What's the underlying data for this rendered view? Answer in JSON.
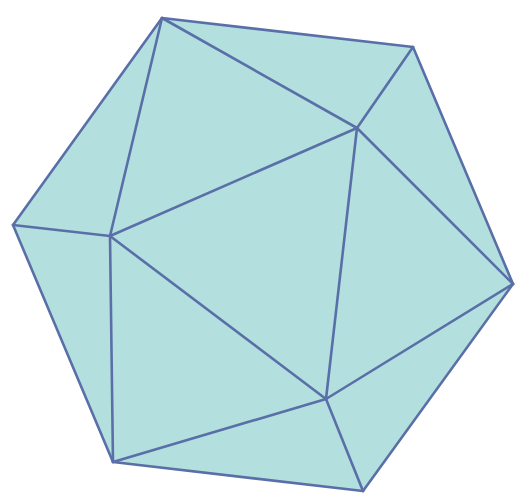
{
  "figure": {
    "type": "icosahedron",
    "fill_color": "#b3e0de",
    "edge_color": "#5a6fa8",
    "vertices": {
      "T": [
        162,
        18
      ],
      "TR": [
        413,
        47
      ],
      "L": [
        13,
        225
      ],
      "IL": [
        110,
        236
      ],
      "IT": [
        357,
        128
      ],
      "R": [
        513,
        284
      ],
      "IB": [
        326,
        399
      ],
      "BL": [
        113,
        462
      ],
      "BR": [
        363,
        491
      ]
    },
    "outline": [
      "T",
      "TR",
      "R",
      "BR",
      "BL",
      "L"
    ],
    "edges": [
      [
        "T",
        "TR"
      ],
      [
        "T",
        "L"
      ],
      [
        "T",
        "IL"
      ],
      [
        "T",
        "IT"
      ],
      [
        "TR",
        "IT"
      ],
      [
        "TR",
        "R"
      ],
      [
        "L",
        "IL"
      ],
      [
        "L",
        "BL"
      ],
      [
        "IL",
        "IT"
      ],
      [
        "IL",
        "IB"
      ],
      [
        "IL",
        "BL"
      ],
      [
        "IT",
        "IB"
      ],
      [
        "IT",
        "R"
      ],
      [
        "R",
        "IB"
      ],
      [
        "R",
        "BR"
      ],
      [
        "IB",
        "BL"
      ],
      [
        "IB",
        "BR"
      ],
      [
        "BL",
        "BR"
      ]
    ]
  }
}
